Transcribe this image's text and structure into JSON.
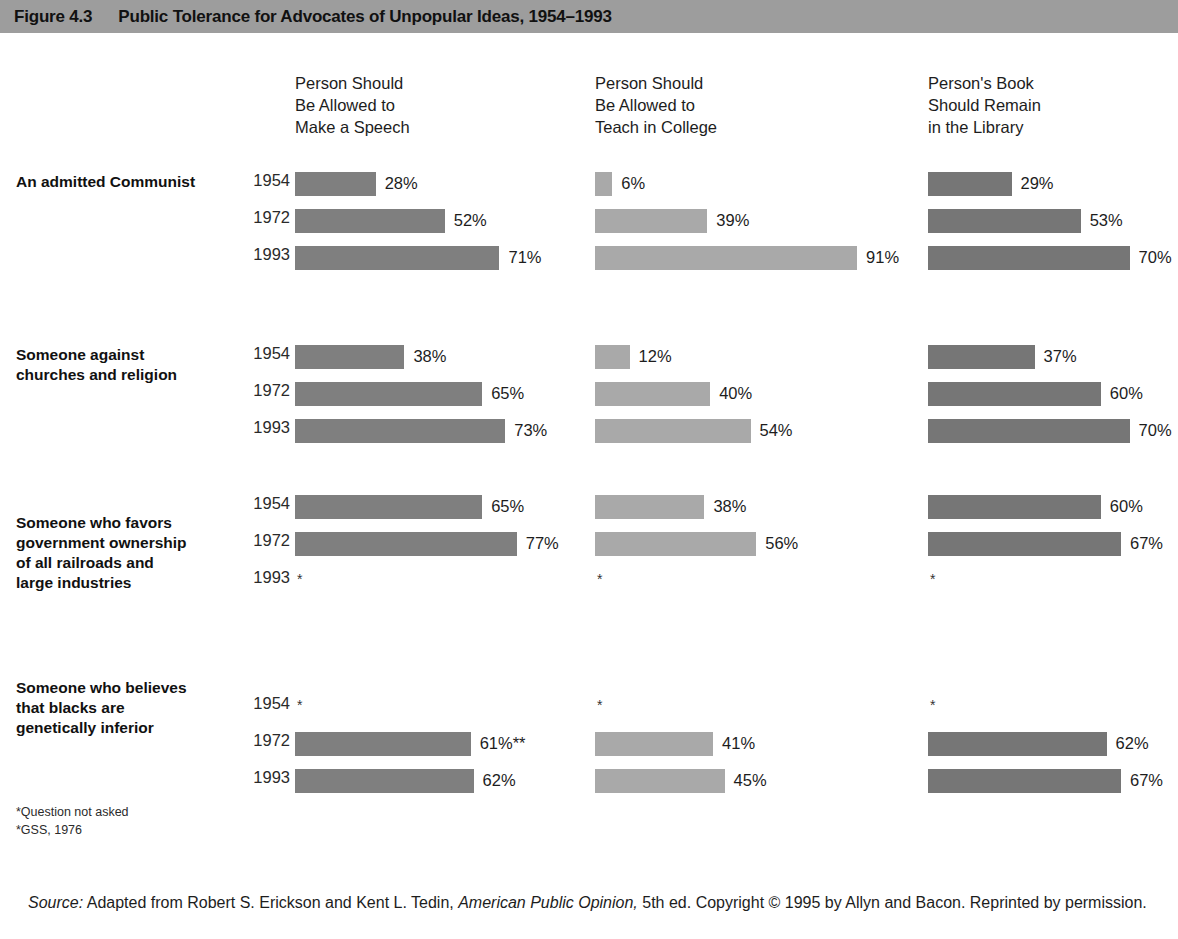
{
  "banner": {
    "figure_number": "Figure 4.3",
    "title": "Public Tolerance for Advocates of Unpopular Ideas, 1954–1993"
  },
  "footnotes": [
    "*Question not asked",
    "*GSS, 1976"
  ],
  "source": {
    "label": "Source:",
    "text_before_italic": " Adapted from Robert S. Erickson and Kent L. Tedin, ",
    "italic_title": "American Public Opinion,",
    "text_after_italic": " 5th ed. Copyright © 1995 by Allyn and Bacon. Reprinted by permission."
  },
  "chart_data": {
    "type": "bar",
    "title": "Public Tolerance for Advocates of Unpopular Ideas, 1954–1993",
    "xlabel": "",
    "ylabel": "",
    "xlim": [
      0,
      100
    ],
    "grid": false,
    "legend_position": "none",
    "value_unit": "percent",
    "columns": [
      {
        "id": "speech",
        "label": "Person Should\nBe Allowed to\nMake a Speech",
        "color": "#7f7f7f"
      },
      {
        "id": "teach",
        "label": "Person Should\nBe Allowed to\nTeach in College",
        "color": "#a9a9a9"
      },
      {
        "id": "library",
        "label": "Person's Book\nShould Remain\nin the Library",
        "color": "#767676"
      }
    ],
    "categories": [
      "1954",
      "1972",
      "1993"
    ],
    "groups": [
      {
        "label": "An admitted Communist",
        "rows": [
          {
            "year": "1954",
            "cells": [
              {
                "value": 28,
                "label": "28%"
              },
              {
                "value": 6,
                "label": "6%"
              },
              {
                "value": 29,
                "label": "29%"
              }
            ]
          },
          {
            "year": "1972",
            "cells": [
              {
                "value": 52,
                "label": "52%"
              },
              {
                "value": 39,
                "label": "39%"
              },
              {
                "value": 53,
                "label": "53%"
              }
            ]
          },
          {
            "year": "1993",
            "cells": [
              {
                "value": 71,
                "label": "71%"
              },
              {
                "value": 91,
                "label": "91%"
              },
              {
                "value": 70,
                "label": "70%"
              }
            ]
          }
        ]
      },
      {
        "label": "Someone against\nchurches and religion",
        "rows": [
          {
            "year": "1954",
            "cells": [
              {
                "value": 38,
                "label": "38%"
              },
              {
                "value": 12,
                "label": "12%"
              },
              {
                "value": 37,
                "label": "37%"
              }
            ]
          },
          {
            "year": "1972",
            "cells": [
              {
                "value": 65,
                "label": "65%"
              },
              {
                "value": 40,
                "label": "40%"
              },
              {
                "value": 60,
                "label": "60%"
              }
            ]
          },
          {
            "year": "1993",
            "cells": [
              {
                "value": 73,
                "label": "73%"
              },
              {
                "value": 54,
                "label": "54%"
              },
              {
                "value": 70,
                "label": "70%"
              }
            ]
          }
        ]
      },
      {
        "label": "Someone who favors\ngovernment ownership\nof all railroads and\nlarge industries",
        "rows": [
          {
            "year": "1954",
            "cells": [
              {
                "value": 65,
                "label": "65%"
              },
              {
                "value": 38,
                "label": "38%"
              },
              {
                "value": 60,
                "label": "60%"
              }
            ]
          },
          {
            "year": "1972",
            "cells": [
              {
                "value": 77,
                "label": "77%"
              },
              {
                "value": 56,
                "label": "56%"
              },
              {
                "value": 67,
                "label": "67%"
              }
            ]
          },
          {
            "year": "1993",
            "cells": [
              {
                "value": null,
                "label": "*"
              },
              {
                "value": null,
                "label": "*"
              },
              {
                "value": null,
                "label": "*"
              }
            ]
          }
        ]
      },
      {
        "label": "Someone who believes\nthat blacks are\ngenetically inferior",
        "rows": [
          {
            "year": "1954",
            "cells": [
              {
                "value": null,
                "label": "*"
              },
              {
                "value": null,
                "label": "*"
              },
              {
                "value": null,
                "label": "*"
              }
            ]
          },
          {
            "year": "1972",
            "cells": [
              {
                "value": 61,
                "label": "61%**"
              },
              {
                "value": 41,
                "label": "41%"
              },
              {
                "value": 62,
                "label": "62%"
              }
            ]
          },
          {
            "year": "1993",
            "cells": [
              {
                "value": 62,
                "label": "62%"
              },
              {
                "value": 45,
                "label": "45%"
              },
              {
                "value": 67,
                "label": "67%"
              }
            ]
          }
        ]
      }
    ]
  }
}
